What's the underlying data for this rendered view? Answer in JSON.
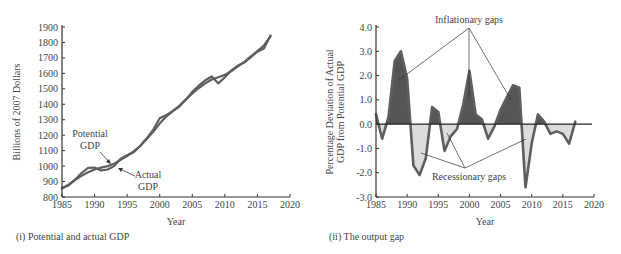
{
  "chart_data": [
    {
      "type": "line",
      "title": "",
      "caption": "(i) Potential and actual GDP",
      "xlabel": "Year",
      "ylabel": "Billions of 2007 Dollars",
      "xlim": [
        1985,
        2020
      ],
      "ylim": [
        800,
        1900
      ],
      "xticks": [
        1985,
        1990,
        1995,
        2000,
        2005,
        2010,
        2015,
        2020
      ],
      "yticks": [
        800,
        900,
        1000,
        1100,
        1200,
        1300,
        1400,
        1500,
        1600,
        1700,
        1800,
        1900
      ],
      "grid": false,
      "x": [
        1985,
        1986,
        1987,
        1988,
        1989,
        1990,
        1991,
        1992,
        1993,
        1994,
        1995,
        1996,
        1997,
        1998,
        1999,
        2000,
        2001,
        2002,
        2003,
        2004,
        2005,
        2006,
        2007,
        2008,
        2009,
        2010,
        2011,
        2012,
        2013,
        2014,
        2015,
        2016,
        2017
      ],
      "series": [
        {
          "name": "Potential GDP",
          "values": [
            855,
            880,
            910,
            937,
            960,
            978,
            990,
            1000,
            1015,
            1040,
            1065,
            1095,
            1130,
            1175,
            1222,
            1275,
            1320,
            1355,
            1390,
            1430,
            1470,
            1505,
            1535,
            1560,
            1575,
            1590,
            1615,
            1645,
            1675,
            1710,
            1745,
            1780,
            1840
          ]
        },
        {
          "name": "Actual GDP",
          "values": [
            858,
            875,
            912,
            955,
            988,
            990,
            972,
            978,
            1000,
            1048,
            1070,
            1090,
            1130,
            1180,
            1235,
            1310,
            1330,
            1355,
            1385,
            1430,
            1480,
            1520,
            1555,
            1580,
            1535,
            1575,
            1620,
            1650,
            1670,
            1705,
            1740,
            1760,
            1845
          ]
        }
      ],
      "annotations": [
        {
          "text": "Potential GDP",
          "lines": [
            "Potential",
            "GDP"
          ]
        },
        {
          "text": "Actual GDP",
          "lines": [
            "Actual",
            "GDP"
          ]
        }
      ]
    },
    {
      "type": "area",
      "title": "",
      "caption": "(ii) The output gap",
      "xlabel": "Year",
      "ylabel": "Percentage Deviation of Actual GDP from Potential GDP",
      "ylabel_lines": [
        "Percentage Deviation of Actual",
        "GDP from Potential GDP"
      ],
      "xlim": [
        1985,
        2020
      ],
      "ylim": [
        -3.0,
        4.0
      ],
      "xticks": [
        1985,
        1990,
        1995,
        2000,
        2005,
        2010,
        2015,
        2020
      ],
      "yticks": [
        -3.0,
        -2.0,
        -1.0,
        0.0,
        1.0,
        2.0,
        3.0,
        4.0
      ],
      "ytick_labels": [
        "-3.0",
        "-2.0",
        "-1.0",
        "0.0",
        "1.0",
        "2.0",
        "3.0",
        "4.0"
      ],
      "grid": false,
      "x": [
        1985,
        1986,
        1987,
        1988,
        1989,
        1990,
        1991,
        1992,
        1993,
        1994,
        1995,
        1996,
        1997,
        1998,
        1999,
        2000,
        2001,
        2002,
        2003,
        2004,
        2005,
        2006,
        2007,
        2008,
        2009,
        2010,
        2011,
        2012,
        2013,
        2014,
        2015,
        2016,
        2017
      ],
      "series": [
        {
          "name": "Output gap (%)",
          "values": [
            0.4,
            -0.6,
            0.3,
            2.6,
            3.0,
            1.9,
            -1.7,
            -2.1,
            -1.4,
            0.7,
            0.5,
            -1.1,
            -0.5,
            -0.2,
            0.8,
            2.2,
            0.4,
            0.2,
            -0.6,
            -0.1,
            0.6,
            1.1,
            1.6,
            1.5,
            -2.6,
            -0.8,
            0.4,
            0.1,
            -0.4,
            -0.3,
            -0.4,
            -0.8,
            0.1
          ]
        }
      ],
      "fills": {
        "positive": "Inflationary gaps",
        "negative": "Recessionary gaps"
      },
      "annotations": [
        {
          "text": "Inflationary gaps"
        },
        {
          "text": "Recessionary gaps"
        }
      ]
    }
  ],
  "colors": {
    "line": "#5e5e5e",
    "inflationary_fill": "#555555",
    "recessionary_fill": "#dcdcdc",
    "axis": "#333333"
  },
  "labels": {
    "left": {
      "caption": "(i) Potential and actual GDP",
      "xlabel": "Year",
      "ylabel": "Billions of 2007 Dollars",
      "potential_1": "Potential",
      "potential_2": "GDP",
      "actual_1": "Actual",
      "actual_2": "GDP"
    },
    "right": {
      "caption": "(ii) The output gap",
      "xlabel": "Year",
      "ylabel_1": "Percentage Deviation of Actual",
      "ylabel_2": "GDP from Potential GDP",
      "inflationary": "Inflationary gaps",
      "recessionary": "Recessionary gaps"
    }
  }
}
